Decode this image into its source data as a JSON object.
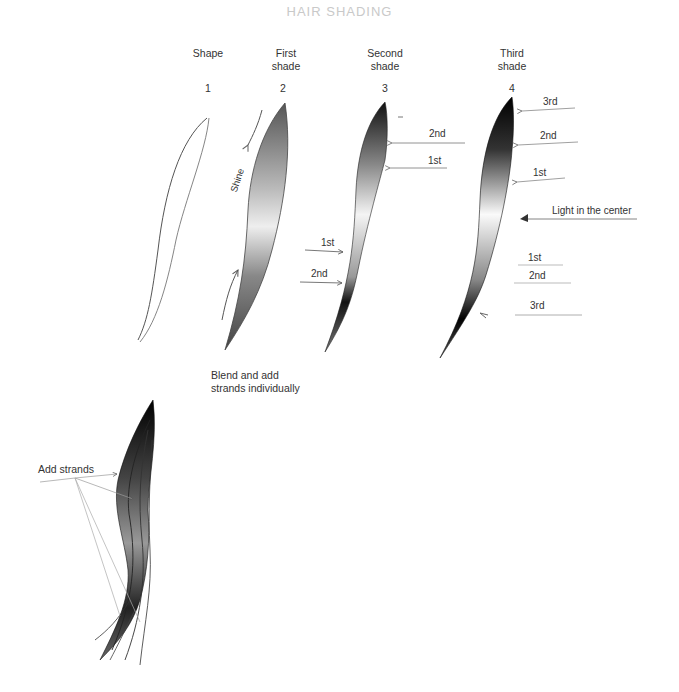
{
  "title": "HAIR SHADING",
  "steps": [
    {
      "number": "1",
      "heading": "Shape"
    },
    {
      "number": "2",
      "heading": "First\nshade"
    },
    {
      "number": "3",
      "heading": "Second\nshade"
    },
    {
      "number": "4",
      "heading": "Third\nshade"
    }
  ],
  "step2_annotations": {
    "shine": "Shine"
  },
  "step3_annotations": {
    "top_2nd": "2nd",
    "top_1st": "1st",
    "bottom_1st": "1st",
    "bottom_2nd": "2nd"
  },
  "step4_annotations": {
    "top_3rd": "3rd",
    "top_2nd": "2nd",
    "top_1st": "1st",
    "center": "Light in the center",
    "bottom_1st": "1st",
    "bottom_2nd": "2nd",
    "bottom_3rd": "3rd"
  },
  "blend_note": "Blend and add\nstrands individually",
  "add_strands": "Add strands"
}
